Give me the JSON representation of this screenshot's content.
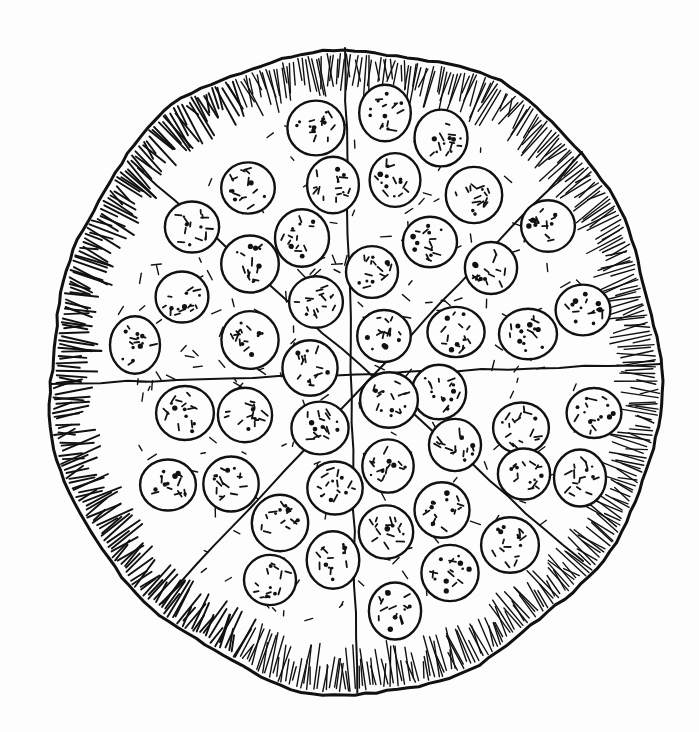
{
  "illustration": {
    "subject": "pepperoni pizza",
    "style": "black ink line drawing",
    "ink_color": "#111111",
    "paper_color": "#fdfdfd",
    "pizza": {
      "cx": 355,
      "cy": 370,
      "rx": 305,
      "ry": 322,
      "crust_width": 48
    },
    "slice_count": 8,
    "slice_lines": [
      {
        "x1": 345,
        "y1": 48,
        "x2": 357,
        "y2": 692
      },
      {
        "x1": 50,
        "y1": 384,
        "x2": 660,
        "y2": 364
      },
      {
        "x1": 138,
        "y1": 168,
        "x2": 582,
        "y2": 562
      },
      {
        "x1": 582,
        "y1": 152,
        "x2": 162,
        "y2": 602
      }
    ],
    "pepperoni_radius": 27,
    "pepperoni": [
      [
        385,
        113
      ],
      [
        316,
        128
      ],
      [
        441,
        138
      ],
      [
        248,
        188
      ],
      [
        333,
        185
      ],
      [
        395,
        180
      ],
      [
        474,
        195
      ],
      [
        192,
        227
      ],
      [
        302,
        238
      ],
      [
        430,
        242
      ],
      [
        548,
        226
      ],
      [
        182,
        297
      ],
      [
        250,
        264
      ],
      [
        372,
        272
      ],
      [
        491,
        268
      ],
      [
        583,
        310
      ],
      [
        135,
        345
      ],
      [
        316,
        302
      ],
      [
        384,
        336
      ],
      [
        456,
        332
      ],
      [
        528,
        334
      ],
      [
        250,
        340
      ],
      [
        310,
        368
      ],
      [
        439,
        392
      ],
      [
        185,
        413
      ],
      [
        245,
        415
      ],
      [
        320,
        428
      ],
      [
        389,
        400
      ],
      [
        455,
        445
      ],
      [
        521,
        428
      ],
      [
        594,
        413
      ],
      [
        168,
        485
      ],
      [
        231,
        484
      ],
      [
        335,
        488
      ],
      [
        388,
        466
      ],
      [
        442,
        510
      ],
      [
        524,
        474
      ],
      [
        580,
        478
      ],
      [
        280,
        523
      ],
      [
        386,
        532
      ],
      [
        510,
        545
      ],
      [
        333,
        560
      ],
      [
        270,
        580
      ],
      [
        450,
        573
      ],
      [
        395,
        611
      ]
    ]
  }
}
